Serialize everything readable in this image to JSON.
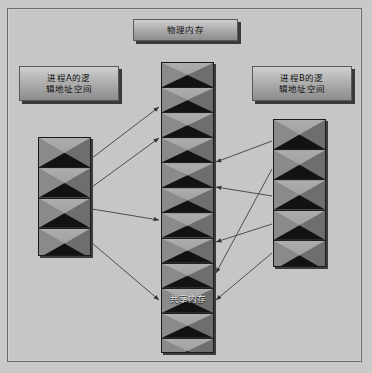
{
  "diagram": {
    "background_color": "#c6c6c6",
    "frame_border_color": "#6b6b6b",
    "labels": {
      "physical_memory": "物理内存",
      "process_a_line1": "进程A的逻",
      "process_a_line2": "辑地址空间",
      "process_b_line1": "进程B的逻",
      "process_b_line2": "辑地址空间",
      "shared_memory": "共享内存"
    },
    "blocks": {
      "physical_memory": {
        "name": "物理内存",
        "cell_count": 12
      },
      "process_a": {
        "name": "进程A的逻辑地址空间",
        "cell_count": 4
      },
      "process_b": {
        "name": "进程B的逻辑地址空间",
        "cell_count": 5
      }
    },
    "colors": {
      "cell_light": "#adadad",
      "cell_mid": "#8a8a8a",
      "cell_dark": "#121212",
      "label_border": "#5a5a5a",
      "shadow": "#3a3a3a",
      "arrow": "#3f3f3f"
    },
    "arrows": [
      {
        "id": "a1",
        "from": "process-a-cell-1",
        "to": "physical-cell-3",
        "x1": 92,
        "y1": 158,
        "x2": 159,
        "y2": 107
      },
      {
        "id": "a2",
        "from": "process-a-cell-2",
        "to": "physical-cell-5",
        "x1": 92,
        "y1": 187,
        "x2": 159,
        "y2": 138
      },
      {
        "id": "a3",
        "from": "process-a-cell-3",
        "to": "physical-cell-8",
        "x1": 92,
        "y1": 209,
        "x2": 159,
        "y2": 220
      },
      {
        "id": "a4",
        "from": "process-a-cell-4",
        "to": "physical-shared",
        "x1": 92,
        "y1": 243,
        "x2": 159,
        "y2": 300
      },
      {
        "id": "b1",
        "from": "process-b-cell-1",
        "to": "physical-cell-6",
        "x1": 272,
        "y1": 141,
        "x2": 216,
        "y2": 162
      },
      {
        "id": "b2",
        "from": "process-b-cell-3",
        "to": "physical-cell-7",
        "x1": 272,
        "y1": 196,
        "x2": 216,
        "y2": 187
      },
      {
        "id": "b3",
        "from": "process-b-cell-4",
        "to": "physical-cell-9",
        "x1": 272,
        "y1": 224,
        "x2": 216,
        "y2": 242
      },
      {
        "id": "b4",
        "from": "process-b-cell-2",
        "to": "physical-cell-10",
        "x1": 272,
        "y1": 169,
        "x2": 216,
        "y2": 273
      },
      {
        "id": "b5",
        "from": "process-b-cell-5",
        "to": "physical-shared",
        "x1": 272,
        "y1": 253,
        "x2": 216,
        "y2": 300
      }
    ]
  }
}
